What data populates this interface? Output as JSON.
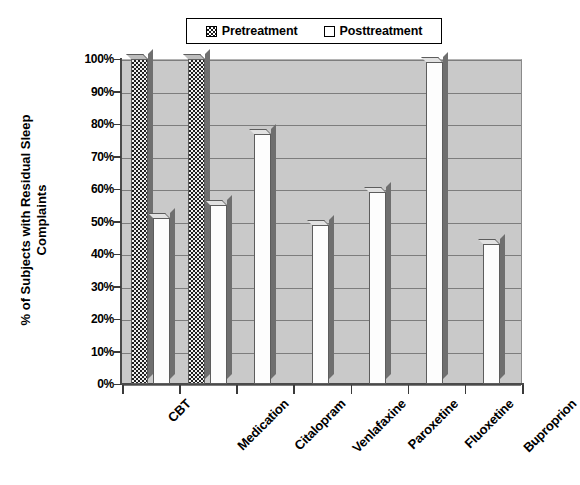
{
  "chart_data": {
    "type": "bar",
    "title": "",
    "xlabel": "",
    "ylabel": "% of Subjects with Residual Sleep\nComplaints",
    "ylim": [
      0,
      100
    ],
    "ytick_labels": [
      "100%",
      "90%",
      "80%",
      "70%",
      "60%",
      "50%",
      "40%",
      "30%",
      "20%",
      "10%",
      "0%"
    ],
    "ytick_values": [
      100,
      90,
      80,
      70,
      60,
      50,
      40,
      30,
      20,
      10,
      0
    ],
    "grid": true,
    "legend_position": "top",
    "categories": [
      "CBT",
      "Medication",
      "Citalopram",
      "Venlafaxine",
      "Paroxetine",
      "Fluoxetine",
      "Buproprion"
    ],
    "series": [
      {
        "name": "Pretreatment",
        "values": [
          100,
          100,
          null,
          null,
          null,
          null,
          null
        ]
      },
      {
        "name": "Posttreatment",
        "values": [
          51,
          55,
          77,
          49,
          59,
          99,
          43
        ]
      }
    ]
  },
  "legend": {
    "items": [
      {
        "label": "Pretreatment",
        "swatch": "checkered-swatch"
      },
      {
        "label": "Posttreatment",
        "swatch": "white-swatch"
      }
    ]
  },
  "colors": {
    "plot_background": "#c9c9c9",
    "gridline": "#7d7d7d",
    "axis": "#4a4a4a",
    "posttreatment_fill": "#fdfdfd",
    "pretreatment_fill": "#202020",
    "bar_outline": "#5d5d5d",
    "text": "#000000"
  }
}
